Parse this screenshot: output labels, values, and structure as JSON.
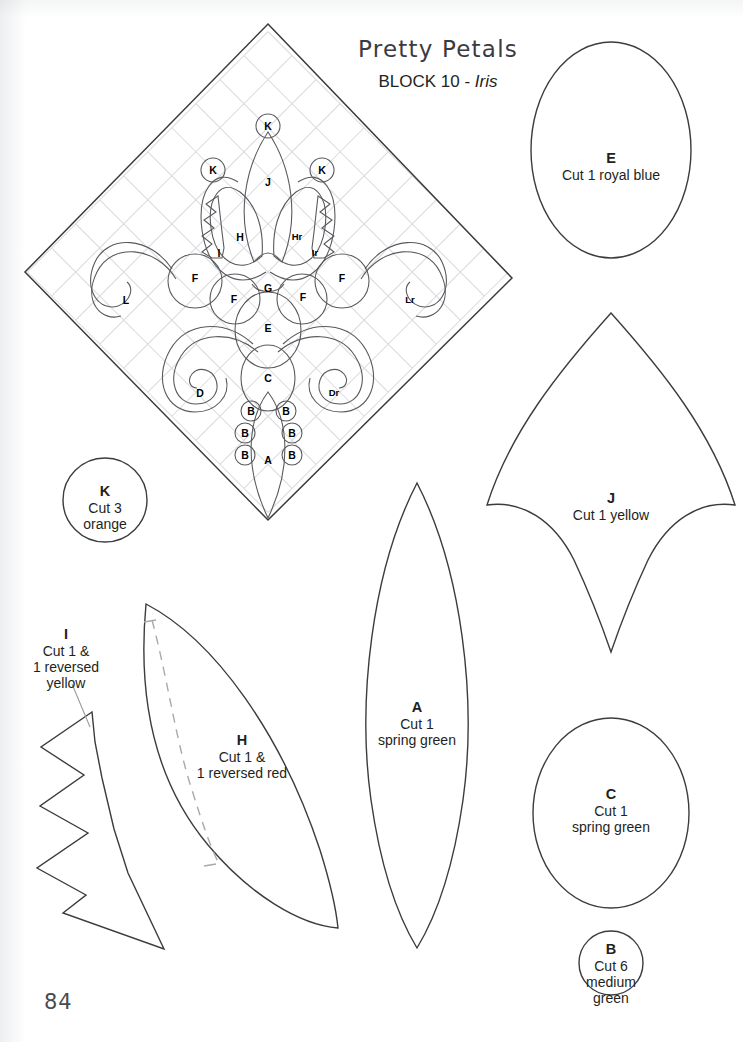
{
  "page": {
    "number": "84",
    "title": "Pretty Petals",
    "block_line_prefix": "BLOCK 10 - ",
    "block_name": "Iris"
  },
  "block_diagram": {
    "name": "iris-block-layout",
    "labels": [
      {
        "text": "K",
        "x": 268,
        "y": 126,
        "circled": true
      },
      {
        "text": "K",
        "x": 213,
        "y": 170,
        "circled": true
      },
      {
        "text": "K",
        "x": 322,
        "y": 170,
        "circled": true
      },
      {
        "text": "J",
        "x": 268,
        "y": 182,
        "circled": false
      },
      {
        "text": "H",
        "x": 240,
        "y": 237,
        "circled": false
      },
      {
        "text": "Hr",
        "x": 297,
        "y": 237,
        "circled": false
      },
      {
        "text": "I",
        "x": 219,
        "y": 253,
        "circled": false
      },
      {
        "text": "Ir",
        "x": 315,
        "y": 253,
        "circled": false
      },
      {
        "text": "F",
        "x": 195,
        "y": 278,
        "circled": false
      },
      {
        "text": "F",
        "x": 234,
        "y": 299,
        "circled": false
      },
      {
        "text": "F",
        "x": 303,
        "y": 297,
        "circled": false
      },
      {
        "text": "F",
        "x": 342,
        "y": 278,
        "circled": false
      },
      {
        "text": "G",
        "x": 268,
        "y": 288,
        "circled": false
      },
      {
        "text": "L",
        "x": 126,
        "y": 300,
        "circled": false
      },
      {
        "text": "Lr",
        "x": 410,
        "y": 300,
        "circled": false
      },
      {
        "text": "E",
        "x": 268,
        "y": 328,
        "circled": false
      },
      {
        "text": "D",
        "x": 200,
        "y": 393,
        "circled": false
      },
      {
        "text": "Dr",
        "x": 334,
        "y": 393,
        "circled": false
      },
      {
        "text": "C",
        "x": 268,
        "y": 378,
        "circled": false
      },
      {
        "text": "B",
        "x": 251,
        "y": 411,
        "circled": true
      },
      {
        "text": "B",
        "x": 286,
        "y": 411,
        "circled": true
      },
      {
        "text": "B",
        "x": 245,
        "y": 433,
        "circled": true
      },
      {
        "text": "B",
        "x": 292,
        "y": 433,
        "circled": true
      },
      {
        "text": "B",
        "x": 245,
        "y": 455,
        "circled": true
      },
      {
        "text": "B",
        "x": 292,
        "y": 455,
        "circled": true
      },
      {
        "text": "A",
        "x": 268,
        "y": 460,
        "circled": false
      }
    ]
  },
  "templates": [
    {
      "id": "template-k",
      "letter": "K",
      "cut_text": "Cut 3\norange",
      "label_x": 105,
      "label_y": 483
    },
    {
      "id": "template-e",
      "letter": "E",
      "cut_text": "Cut 1 royal blue",
      "label_x": 611,
      "label_y": 150
    },
    {
      "id": "template-j",
      "letter": "J",
      "cut_text": "Cut 1 yellow",
      "label_x": 611,
      "label_y": 490
    },
    {
      "id": "template-c",
      "letter": "C",
      "cut_text": "Cut 1\nspring green",
      "label_x": 611,
      "label_y": 786
    },
    {
      "id": "template-b",
      "letter": "B",
      "cut_text": "Cut 6\nmedium\ngreen",
      "label_x": 611,
      "label_y": 941
    },
    {
      "id": "template-a",
      "letter": "A",
      "cut_text": "Cut 1\nspring green",
      "label_x": 417,
      "label_y": 699
    },
    {
      "id": "template-h",
      "letter": "H",
      "cut_text": "Cut 1 &\n1 reversed red",
      "label_x": 242,
      "label_y": 732
    },
    {
      "id": "template-i",
      "letter": "I",
      "cut_text": "Cut 1 &\n1 reversed\nyellow",
      "label_x": 66,
      "label_y": 626
    }
  ],
  "colors": {
    "ink": "#231f20",
    "outline": "#3c3c40",
    "grid": "#d8d9dd",
    "dashed_guide": "#a9a9ad",
    "page_background": "#ffffff"
  }
}
